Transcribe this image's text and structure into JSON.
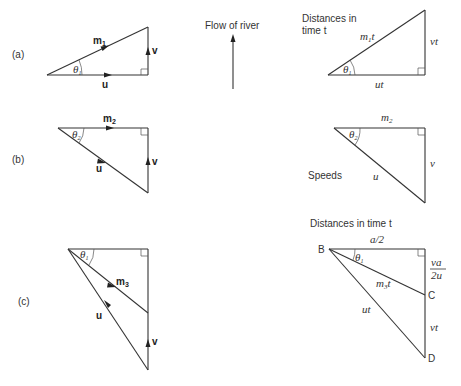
{
  "header": {
    "flow_label": "Flow of river"
  },
  "panels": {
    "a": {
      "label": "(a)",
      "velocity": {
        "hyp": "m",
        "hyp_sub": "1",
        "base": "u",
        "side": "v",
        "angle": "θ",
        "angle_sub": "1"
      },
      "distance": {
        "title_line1": "Distances in",
        "title_line2": "time t",
        "hyp": "m",
        "hyp_sub": "1",
        "hyp_suffix": "t",
        "base": "ut",
        "side": "vt",
        "angle": "θ",
        "angle_sub": "1"
      }
    },
    "b": {
      "label": "(b)",
      "velocity": {
        "top": "m",
        "top_sub": "2",
        "hyp": "u",
        "side": "v",
        "angle": "θ",
        "angle_sub": "2"
      },
      "speed": {
        "title": "Speeds",
        "top": "m",
        "top_sub": "2",
        "hyp": "u",
        "side": "v",
        "angle": "θ",
        "angle_sub": "2"
      }
    },
    "c": {
      "label": "(c)",
      "velocity": {
        "mid": "m",
        "mid_sub": "3",
        "hyp": "u",
        "side": "v",
        "angle": "θ",
        "angle_sub": "1"
      },
      "distance": {
        "title": "Distances in time t",
        "top": "a/2",
        "mid": "m",
        "mid_sub": "3",
        "mid_suffix": "t",
        "hyp": "ut",
        "upper_side_num": "va",
        "upper_side_den": "2u",
        "lower_side": "vt",
        "angle": "θ",
        "angle_sub": "1",
        "point_b": "B",
        "point_c": "C",
        "point_d": "D"
      }
    }
  }
}
